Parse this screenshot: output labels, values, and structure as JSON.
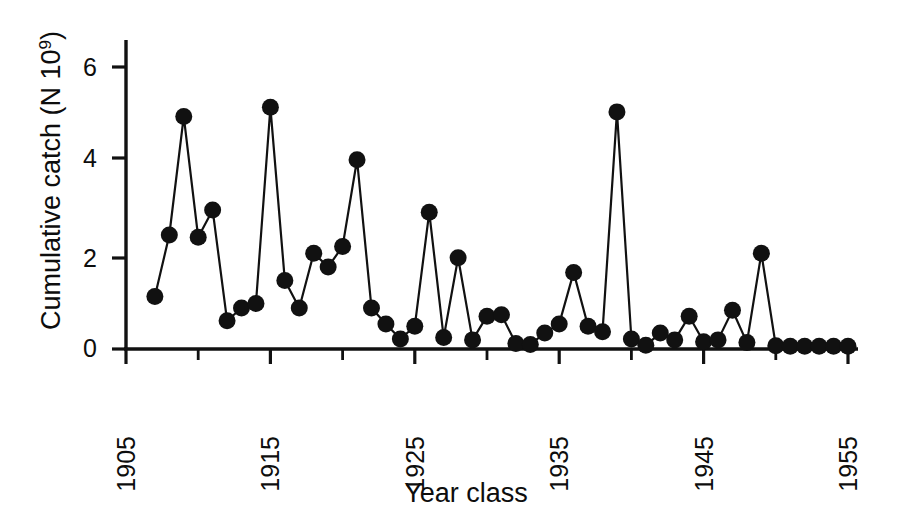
{
  "figure": {
    "background_color": "#ffffff",
    "ink_color": "#111111",
    "marker_color": "#111111"
  },
  "axes": {
    "x_label": "Year class",
    "y_label_prefix": "Cumulative catch (N 10",
    "y_label_exponent": "9",
    "y_label_suffix": ")",
    "y_ticks": [
      "0",
      "2",
      "4",
      "6"
    ],
    "y_tick_values": [
      0,
      2,
      4,
      6
    ],
    "x_ticks": [
      "1905",
      "1915",
      "1925",
      "1935",
      "1945",
      "1955"
    ],
    "x_tick_values": [
      1905,
      1915,
      1925,
      1935,
      1945,
      1955
    ],
    "x_minor_tick_values": [
      1910,
      1920,
      1930,
      1940,
      1950
    ],
    "x_tick_label_rotation": -90
  },
  "chart_data": {
    "type": "line",
    "title": "",
    "subtitle": "",
    "xlabel": "Year class",
    "ylabel": "Cumulative catch (N 10^9)",
    "xlim": [
      1904,
      1956
    ],
    "ylim": [
      0,
      6.6
    ],
    "grid": false,
    "legend": "none",
    "marker": "filled-circle",
    "marker_size": 17,
    "line_width": 2.2,
    "series": [
      {
        "name": "Cumulative catch",
        "x": [
          1907,
          1908,
          1909,
          1910,
          1911,
          1912,
          1913,
          1914,
          1915,
          1916,
          1917,
          1918,
          1919,
          1920,
          1921,
          1922,
          1923,
          1924,
          1925,
          1926,
          1927,
          1928,
          1929,
          1930,
          1931,
          1932,
          1933,
          1934,
          1935,
          1936,
          1937,
          1938,
          1939,
          1940,
          1941,
          1942,
          1943,
          1944,
          1945,
          1946,
          1947,
          1948,
          1949,
          1950,
          1951,
          1952,
          1953,
          1954,
          1955
        ],
        "y": [
          1.15,
          2.5,
          5.1,
          2.45,
          3.05,
          0.62,
          0.9,
          1.0,
          5.3,
          1.5,
          0.9,
          2.1,
          1.8,
          2.25,
          4.15,
          0.9,
          0.55,
          0.22,
          0.5,
          3.0,
          0.25,
          2.0,
          0.2,
          0.72,
          0.75,
          0.12,
          0.1,
          0.35,
          0.55,
          1.68,
          0.5,
          0.38,
          5.2,
          0.22,
          0.08,
          0.35,
          0.2,
          0.72,
          0.16,
          0.2,
          0.85,
          0.14,
          2.1,
          0.07,
          0.06,
          0.06,
          0.06,
          0.06,
          0.06
        ]
      }
    ]
  }
}
